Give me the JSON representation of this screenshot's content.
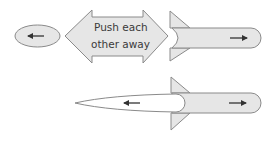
{
  "diagram": {
    "colors": {
      "fill": "#e6e6e6",
      "stroke": "#8a8a8a",
      "arrow": "#333333",
      "background": "#ffffff",
      "exhaust_fill": "#ffffff"
    },
    "top_row": {
      "ejected_mass": {
        "arrow_direction": "left",
        "icon": "arrow-left-icon"
      },
      "callout": {
        "line1": "Push each",
        "line2": "other away",
        "shape": "double-headed-arrow"
      },
      "rocket": {
        "arrow_direction": "right",
        "icon": "arrow-right-icon"
      }
    },
    "bottom_row": {
      "exhaust": {
        "arrow_direction": "left",
        "icon": "arrow-left-icon"
      },
      "rocket": {
        "arrow_direction": "right",
        "icon": "arrow-right-icon"
      }
    }
  }
}
